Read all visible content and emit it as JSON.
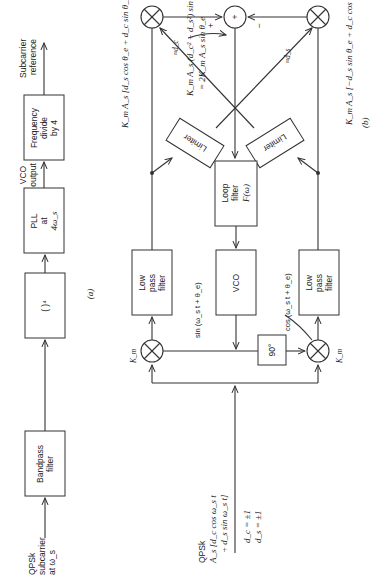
{
  "figure_a": {
    "caption": "(a)",
    "input_label": [
      "QPSk",
      "subcarrier",
      "at ω_s"
    ],
    "blocks": [
      {
        "id": "bandpass",
        "lines": [
          "Bandpass",
          "filter"
        ]
      },
      {
        "id": "fourth-power",
        "lines": [
          "(  )⁴"
        ]
      },
      {
        "id": "pll",
        "lines": [
          "PLL",
          "at",
          "4ω_s"
        ]
      },
      {
        "id": "freq-divide",
        "lines": [
          "Frequency",
          "divide",
          "by 4"
        ]
      }
    ],
    "vco_output_label": [
      "VCO",
      "output"
    ],
    "output_label": [
      "Subcarrier",
      "reference"
    ]
  },
  "figure_b": {
    "caption": "(b)",
    "input_label": [
      "QPSk",
      "A_s [d_c cos ω_s t",
      "+ d_s sin ω_s t]"
    ],
    "data_values": [
      "d_c = ±1",
      "d_s = ±1"
    ],
    "multiplier_gain": "K_m",
    "phase_shift": "90°",
    "vco": "VCO",
    "sin_label": "sin (ω_s t + θ_e)",
    "cos_label": "cos (ω_s t + θ_e)",
    "lpf_lines": [
      "Low",
      "pass",
      "filter"
    ],
    "loop_filter_lines": [
      "Loop",
      "filter",
      "F(ω)"
    ],
    "limiter": "Limiter",
    "upper_branch_expr": "K_m A_s [d_s cos θ_e + d_c sin θ_e]",
    "lower_branch_expr": "K_m A_s [−d_s sin θ_e + d_c cos θ_e]",
    "approx_dc": "≈d_c",
    "approx_ds": "≈d_s",
    "summer_plus": "+",
    "summer_minus": "−",
    "summer_symbol": "+",
    "summer_output_expr_1": "K_m A_s (d_c² + d_s²) sin θ_e",
    "summer_output_expr_2": "= 2K_m A_s sin θ_e"
  }
}
